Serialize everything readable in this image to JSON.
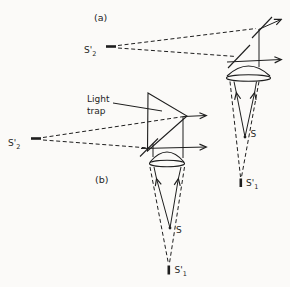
{
  "canvas": {
    "width": 290,
    "height": 287,
    "paper_color": "#fbfaf8",
    "ink_color": "#1e1e1e"
  },
  "panel_a": {
    "label": "(a)",
    "source": {
      "label": "S"
    },
    "virtual_image_axial": {
      "base": "S'",
      "sub": "1"
    },
    "virtual_image_lateral": {
      "base": "S'",
      "sub": "2"
    }
  },
  "panel_b": {
    "label": "(b)",
    "light_trap": {
      "line1": "Light",
      "line2": "trap"
    },
    "source": {
      "label": "S"
    },
    "virtual_image_axial": {
      "base": "S'",
      "sub": "1"
    },
    "virtual_image_lateral": {
      "base": "S'",
      "sub": "2"
    }
  }
}
